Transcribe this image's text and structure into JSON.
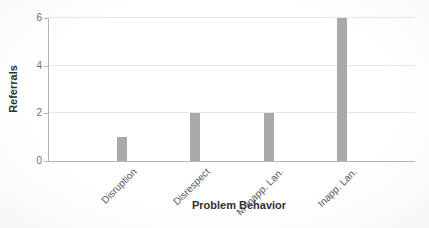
{
  "chart_data": {
    "type": "bar",
    "categories": [
      "Disruption",
      "Disrespect",
      "M-Inapp. Lan.",
      "Inapp. Lan."
    ],
    "values": [
      1,
      2,
      2,
      6
    ],
    "title": "",
    "xlabel": "Problem Behavior",
    "ylabel": "Referrals",
    "ylim": [
      0,
      6
    ],
    "yticks": [
      0,
      2,
      4,
      6
    ],
    "grid": "horizontal",
    "legend": "none",
    "colors": {
      "bar_fill": "#a9a9a9",
      "axis_line": "#b3b3b3",
      "gridline": "#e6e6e6",
      "tick_label": "#6e6e6e",
      "category_label": "#565656",
      "axis_title": "#2f2f2f"
    }
  }
}
